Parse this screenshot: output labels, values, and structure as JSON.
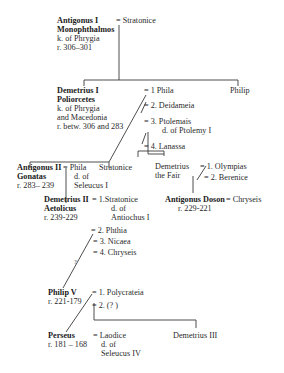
{
  "diagram": {
    "type": "family-tree",
    "nodes": {
      "antigonus1": {
        "name1": "Antigonus I",
        "name2": "Monophthalmos",
        "title": "k. of Phrygia",
        "reign": "r. 306–301"
      },
      "stratonice_wife": {
        "label": "= Stratonice"
      },
      "demetrius1": {
        "name1": "Demetrius I",
        "name2": "Poliorcetes",
        "title1": "k. of Phrygia",
        "title2": "and Macedonia",
        "reign": "r. betw. 306 and 283"
      },
      "philip": {
        "name": "Philip"
      },
      "demetrius1_wives": [
        {
          "label": "= 1 Phila"
        },
        {
          "label": "= 2. Deidameia"
        },
        {
          "label": "= 3. Ptolemais",
          "note": "d. of Ptolemy I"
        },
        {
          "label": "= 4. Lanassa"
        }
      ],
      "antigonus2": {
        "name1": "Antigonus II",
        "name2": "Gonatas",
        "reign": "r. 283– 239"
      },
      "antigonus2_wife": {
        "label": "= Phila",
        "note1": "d. of",
        "note2": "Seleucus I"
      },
      "stratonice_daughter": {
        "name": "Stratonice"
      },
      "demetrius_fair": {
        "name1": "Demetrius",
        "name2": "the Fair"
      },
      "demetrius_fair_wives": [
        {
          "label": "= 1. Olympias"
        },
        {
          "label": "= 2. Berenice"
        }
      ],
      "antigonus_doson": {
        "name": "Antigonus Doson",
        "reign": "r. 229-221"
      },
      "doson_wife": {
        "label": "= Chryseis"
      },
      "demetrius2": {
        "name1": "Demetrius II",
        "name2": "Aetolicus",
        "reign": "r. 239-229"
      },
      "demetrius2_wives": [
        {
          "label": "= 1.Stratonice",
          "note1": "d. of",
          "note2": "Antiochus I"
        },
        {
          "label": "= 2. Phthia"
        },
        {
          "label": "= 3. Nicaea"
        },
        {
          "label": "= 4. Chryseis"
        }
      ],
      "uncertain_mark": "?",
      "philip5": {
        "name": "Philip V",
        "reign": "r. 221-179"
      },
      "philip5_wives": [
        {
          "label": "= 1. Polycrateia"
        },
        {
          "label": "= 2. (? )"
        }
      ],
      "perseus": {
        "name": "Perseus",
        "reign": "r. 181 – 168"
      },
      "perseus_wife": {
        "label": "= Laodice",
        "note1": "d. of",
        "note2": "Seleucus IV"
      },
      "demetrius3": {
        "name": "Demetrius III"
      }
    }
  }
}
